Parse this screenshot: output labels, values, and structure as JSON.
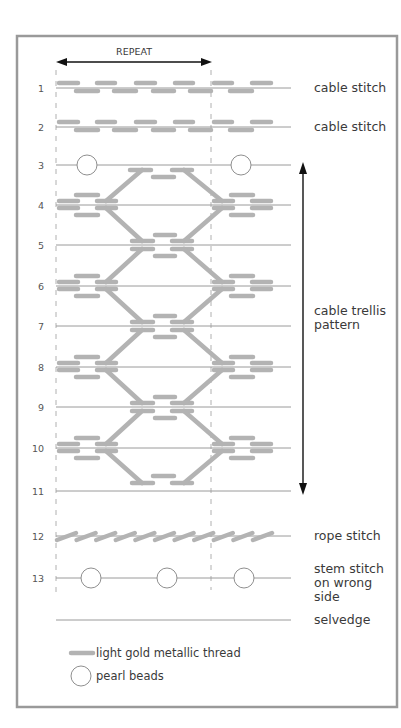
{
  "repeat_label": "REPEAT",
  "colors": {
    "thread": "#b3b3b3",
    "frame": "#9a9a9a",
    "line": "#9a9a9a",
    "bead_stroke": "#8f8f8f",
    "arrow": "#111111"
  },
  "frame": {
    "x": 17,
    "y": 36,
    "w": 380,
    "h": 671
  },
  "repeat_arrow": {
    "x1": 56,
    "x2": 212,
    "y": 62,
    "label_x": 134,
    "label_y": 55
  },
  "guides": [
    {
      "x": 56,
      "y1": 70,
      "y2": 598
    },
    {
      "x": 211,
      "y1": 70,
      "y2": 590
    }
  ],
  "line_x1": 56,
  "line_x2": 291,
  "label_x": 314,
  "rows": [
    {
      "num": "1",
      "y": 88
    },
    {
      "num": "2",
      "y": 127
    },
    {
      "num": "3",
      "y": 165
    },
    {
      "num": "4",
      "y": 205
    },
    {
      "num": "5",
      "y": 245
    },
    {
      "num": "6",
      "y": 286
    },
    {
      "num": "7",
      "y": 326
    },
    {
      "num": "8",
      "y": 367
    },
    {
      "num": "9",
      "y": 407
    },
    {
      "num": "10",
      "y": 448
    },
    {
      "num": "11",
      "y": 491
    },
    {
      "num": "12",
      "y": 536
    },
    {
      "num": "13",
      "y": 578
    }
  ],
  "selvedge_y": 620,
  "row_labels": [
    {
      "name": "label-cable-stitch-1",
      "lines": [
        "cable stitch"
      ],
      "y": 92
    },
    {
      "name": "label-cable-stitch-2",
      "lines": [
        "cable stitch"
      ],
      "y": 131
    },
    {
      "name": "label-cable-trellis",
      "lines": [
        "cable trellis",
        "pattern"
      ],
      "y": 315
    },
    {
      "name": "label-rope-stitch",
      "lines": [
        "rope stitch"
      ],
      "y": 540
    },
    {
      "name": "label-stem-stitch",
      "lines": [
        "stem stitch",
        "on wrong",
        "side"
      ],
      "y": 573
    },
    {
      "name": "label-selvedge",
      "lines": [
        "selvedge"
      ],
      "y": 624
    }
  ],
  "trellis_arrow": {
    "x": 303,
    "y1": 162,
    "y2": 495
  },
  "cable_rows": [
    {
      "y": 88,
      "upper": [
        [
          57,
          80
        ],
        [
          95,
          117
        ],
        [
          134,
          157
        ],
        [
          173,
          195
        ],
        [
          212,
          234
        ],
        [
          250,
          273
        ]
      ],
      "lower": [
        [
          74,
          100
        ],
        [
          112,
          138
        ],
        [
          151,
          176
        ],
        [
          188,
          213
        ],
        [
          228,
          254
        ]
      ]
    },
    {
      "y": 127,
      "upper": [
        [
          57,
          80
        ],
        [
          95,
          117
        ],
        [
          134,
          157
        ],
        [
          173,
          195
        ],
        [
          212,
          234
        ],
        [
          250,
          273
        ]
      ],
      "lower": [
        [
          74,
          100
        ],
        [
          112,
          138
        ],
        [
          151,
          176
        ],
        [
          188,
          213
        ],
        [
          228,
          254
        ]
      ]
    }
  ],
  "row3_beads": [
    {
      "x": 87,
      "y": 165
    },
    {
      "x": 241,
      "y": 165
    }
  ],
  "trellis": {
    "side_rows": [
      205,
      286,
      367,
      448
    ],
    "center_rows": [
      245,
      326,
      407
    ],
    "top_center_y": 165,
    "bottom_center_y": 491,
    "side_clusters_x": [
      57,
      212
    ]
  },
  "rope": {
    "y": 536,
    "count": 11,
    "x0": 57,
    "step": 19.6,
    "width": 19
  },
  "row13_beads": [
    {
      "x": 91,
      "y": 578
    },
    {
      "x": 167,
      "y": 578
    },
    {
      "x": 244,
      "y": 578
    }
  ],
  "legend": {
    "thread_label": "light gold metallic thread",
    "bead_label": "pearl beads"
  }
}
